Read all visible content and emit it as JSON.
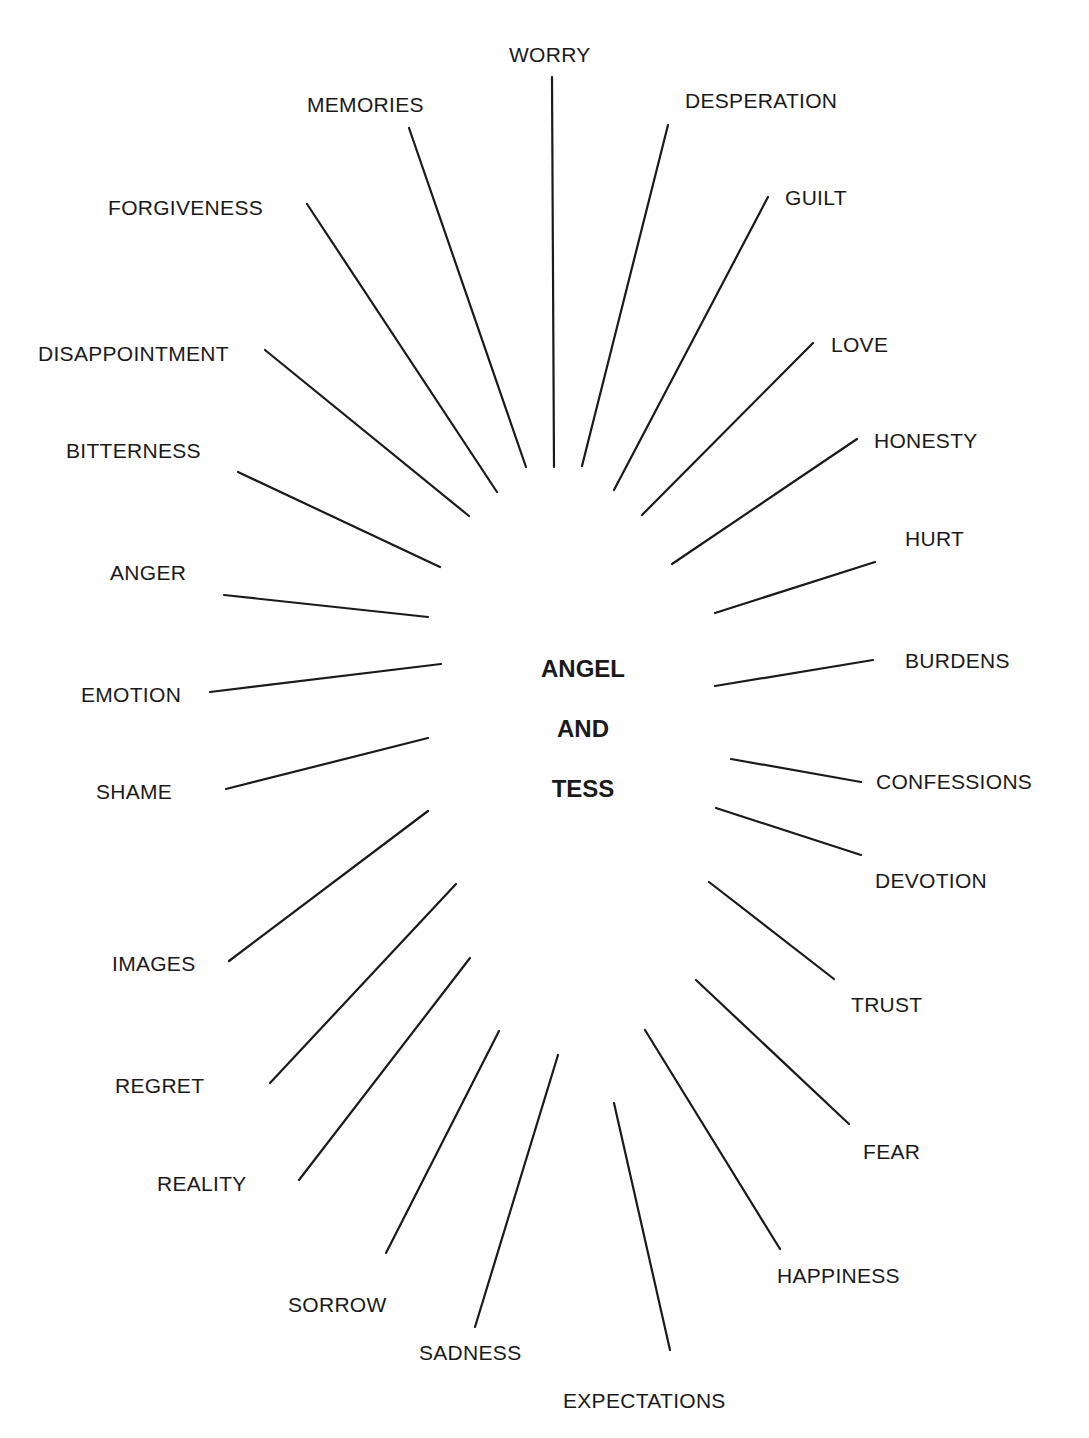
{
  "center": {
    "lines": [
      {
        "text": "ANGEL",
        "x": 583,
        "y": 657
      },
      {
        "text": "AND",
        "x": 583,
        "y": 717
      },
      {
        "text": "TESS",
        "x": 583,
        "y": 777
      }
    ]
  },
  "spokes": [
    {
      "label": "WORRY",
      "lx": 509,
      "ly": 44,
      "x1": 552,
      "y1": 77,
      "x2": 554,
      "y2": 467
    },
    {
      "label": "MEMORIES",
      "lx": 307,
      "ly": 94,
      "x1": 409,
      "y1": 128,
      "x2": 526,
      "y2": 467
    },
    {
      "label": "DESPERATION",
      "lx": 685,
      "ly": 90,
      "x1": 668,
      "y1": 125,
      "x2": 582,
      "y2": 466
    },
    {
      "label": "FORGIVENESS",
      "lx": 108,
      "ly": 197,
      "x1": 307,
      "y1": 204,
      "x2": 497,
      "y2": 492
    },
    {
      "label": "GUILT",
      "lx": 785,
      "ly": 187,
      "x1": 768,
      "y1": 197,
      "x2": 614,
      "y2": 490
    },
    {
      "label": "DISAPPOINTMENT",
      "lx": 38,
      "ly": 343,
      "x1": 265,
      "y1": 350,
      "x2": 469,
      "y2": 516
    },
    {
      "label": "LOVE",
      "lx": 831,
      "ly": 334,
      "x1": 813,
      "y1": 343,
      "x2": 642,
      "y2": 515
    },
    {
      "label": "BITTERNESS",
      "lx": 66,
      "ly": 440,
      "x1": 238,
      "y1": 472,
      "x2": 440,
      "y2": 567
    },
    {
      "label": "HONESTY",
      "lx": 874,
      "ly": 430,
      "x1": 857,
      "y1": 439,
      "x2": 672,
      "y2": 564
    },
    {
      "label": "ANGER",
      "lx": 110,
      "ly": 562,
      "x1": 224,
      "y1": 595,
      "x2": 428,
      "y2": 617
    },
    {
      "label": "HURT",
      "lx": 905,
      "ly": 528,
      "x1": 875,
      "y1": 562,
      "x2": 715,
      "y2": 613
    },
    {
      "label": "EMOTION",
      "lx": 81,
      "ly": 684,
      "x1": 210,
      "y1": 692,
      "x2": 441,
      "y2": 664
    },
    {
      "label": "BURDENS",
      "lx": 905,
      "ly": 650,
      "x1": 873,
      "y1": 660,
      "x2": 715,
      "y2": 686
    },
    {
      "label": "SHAME",
      "lx": 96,
      "ly": 781,
      "x1": 226,
      "y1": 789,
      "x2": 428,
      "y2": 738
    },
    {
      "label": "CONFESSIONS",
      "lx": 876,
      "ly": 771,
      "x1": 861,
      "y1": 782,
      "x2": 731,
      "y2": 759
    },
    {
      "label": "DEVOTION",
      "lx": 875,
      "ly": 870,
      "x1": 861,
      "y1": 855,
      "x2": 716,
      "y2": 808
    },
    {
      "label": "IMAGES",
      "lx": 112,
      "ly": 953,
      "x1": 229,
      "y1": 961,
      "x2": 428,
      "y2": 811
    },
    {
      "label": "TRUST",
      "lx": 851,
      "ly": 994,
      "x1": 834,
      "y1": 979,
      "x2": 709,
      "y2": 882
    },
    {
      "label": "REGRET",
      "lx": 115,
      "ly": 1075,
      "x1": 270,
      "y1": 1083,
      "x2": 456,
      "y2": 884
    },
    {
      "label": "FEAR",
      "lx": 863,
      "ly": 1141,
      "x1": 849,
      "y1": 1124,
      "x2": 696,
      "y2": 980
    },
    {
      "label": "REALITY",
      "lx": 157,
      "ly": 1173,
      "x1": 299,
      "y1": 1180,
      "x2": 470,
      "y2": 958
    },
    {
      "label": "HAPPINESS",
      "lx": 777,
      "ly": 1265,
      "x1": 780,
      "y1": 1249,
      "x2": 645,
      "y2": 1030
    },
    {
      "label": "SORROW",
      "lx": 288,
      "ly": 1294,
      "x1": 386,
      "y1": 1253,
      "x2": 499,
      "y2": 1031
    },
    {
      "label": "SADNESS",
      "lx": 419,
      "ly": 1342,
      "x1": 475,
      "y1": 1327,
      "x2": 558,
      "y2": 1055
    },
    {
      "label": "EXPECTATIONS",
      "lx": 563,
      "ly": 1390,
      "x1": 670,
      "y1": 1350,
      "x2": 614,
      "y2": 1103
    }
  ]
}
